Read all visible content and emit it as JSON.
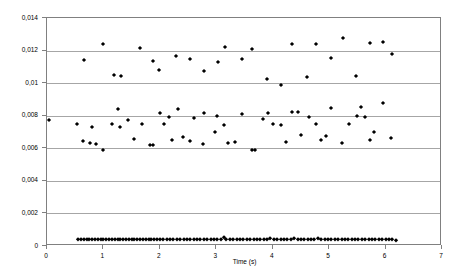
{
  "chart_data": {
    "type": "scatter",
    "title": "",
    "xlabel": "Time (s)",
    "ylabel": "",
    "xlim": [
      0,
      7
    ],
    "ylim": [
      0,
      0.014
    ],
    "grid": true,
    "legend": false,
    "decimal_separator": ",",
    "marker": "diamond",
    "marker_color": "#000000",
    "x_ticks": [
      0,
      1,
      2,
      3,
      4,
      5,
      6,
      7
    ],
    "x_tick_labels": [
      "0",
      "1",
      "2",
      "3",
      "4",
      "5",
      "6",
      "7"
    ],
    "y_ticks": [
      0,
      0.002,
      0.004,
      0.006,
      0.008,
      0.01,
      0.012,
      0.014
    ],
    "y_tick_labels": [
      "0",
      "0,002",
      "0,004",
      "0,006",
      "0,008",
      "0,01",
      "0,012",
      "0,014"
    ],
    "series": [
      {
        "name": "upper-cluster",
        "points": [
          [
            0.66,
            0.01143
          ],
          [
            0.99,
            0.0124
          ],
          [
            1.19,
            0.01049
          ],
          [
            1.32,
            0.01042
          ],
          [
            1.64,
            0.01215
          ],
          [
            1.88,
            0.01133
          ],
          [
            1.99,
            0.01081
          ],
          [
            2.29,
            0.01165
          ],
          [
            2.54,
            0.01148
          ],
          [
            2.78,
            0.01072
          ],
          [
            3.03,
            0.0113
          ],
          [
            3.15,
            0.01221
          ],
          [
            3.45,
            0.01151
          ],
          [
            3.64,
            0.01207
          ],
          [
            3.9,
            0.01028
          ],
          [
            4.14,
            0.00989
          ],
          [
            4.34,
            0.01241
          ],
          [
            4.6,
            0.01035
          ],
          [
            4.76,
            0.01238
          ],
          [
            5.03,
            0.01154
          ],
          [
            5.25,
            0.01277
          ],
          [
            5.48,
            0.01043
          ],
          [
            5.72,
            0.01245
          ],
          [
            5.96,
            0.01252
          ],
          [
            6.12,
            0.01181
          ]
        ]
      },
      {
        "name": "middle-cluster",
        "points": [
          [
            0.03,
            0.00773
          ],
          [
            0.53,
            0.0075
          ],
          [
            0.63,
            0.00643
          ],
          [
            0.77,
            0.00634
          ],
          [
            0.8,
            0.00728
          ],
          [
            0.87,
            0.00628
          ],
          [
            0.99,
            0.00588
          ],
          [
            1.16,
            0.00749
          ],
          [
            1.25,
            0.0084
          ],
          [
            1.29,
            0.00733
          ],
          [
            1.44,
            0.00772
          ],
          [
            1.55,
            0.00659
          ],
          [
            1.69,
            0.0075
          ],
          [
            1.82,
            0.00621
          ],
          [
            1.88,
            0.00618
          ],
          [
            2.01,
            0.00818
          ],
          [
            2.07,
            0.00748
          ],
          [
            2.16,
            0.00795
          ],
          [
            2.21,
            0.00652
          ],
          [
            2.32,
            0.0084
          ],
          [
            2.41,
            0.00671
          ],
          [
            2.54,
            0.00645
          ],
          [
            2.6,
            0.00789
          ],
          [
            2.76,
            0.00628
          ],
          [
            2.79,
            0.00818
          ],
          [
            2.97,
            0.00702
          ],
          [
            3.01,
            0.00799
          ],
          [
            3.13,
            0.00743
          ],
          [
            3.21,
            0.00634
          ],
          [
            3.34,
            0.00639
          ],
          [
            3.45,
            0.00809
          ],
          [
            3.64,
            0.00589
          ],
          [
            3.69,
            0.00589
          ],
          [
            3.82,
            0.00777
          ],
          [
            3.92,
            0.00817
          ],
          [
            4.0,
            0.0075
          ],
          [
            4.14,
            0.00745
          ],
          [
            4.24,
            0.0064
          ],
          [
            4.34,
            0.0082
          ],
          [
            4.44,
            0.00823
          ],
          [
            4.51,
            0.00679
          ],
          [
            4.64,
            0.00792
          ],
          [
            4.76,
            0.00748
          ],
          [
            4.85,
            0.00649
          ],
          [
            4.94,
            0.00677
          ],
          [
            5.04,
            0.0085
          ],
          [
            5.22,
            0.00632
          ],
          [
            5.35,
            0.00748
          ],
          [
            5.49,
            0.00798
          ],
          [
            5.57,
            0.00854
          ],
          [
            5.64,
            0.00793
          ],
          [
            5.72,
            0.00653
          ],
          [
            5.8,
            0.00697
          ],
          [
            5.96,
            0.00879
          ],
          [
            6.1,
            0.00663
          ]
        ]
      },
      {
        "name": "lower-band",
        "points": [
          [
            0.55,
            0.00041
          ],
          [
            0.6,
            0.00041
          ],
          [
            0.65,
            0.00042
          ],
          [
            0.7,
            0.0004
          ],
          [
            0.75,
            0.00042
          ],
          [
            0.8,
            0.00041
          ],
          [
            0.85,
            0.0004
          ],
          [
            0.9,
            0.00042
          ],
          [
            0.95,
            0.00041
          ],
          [
            1.0,
            0.0004
          ],
          [
            1.05,
            0.00042
          ],
          [
            1.1,
            0.00041
          ],
          [
            1.15,
            0.0004
          ],
          [
            1.2,
            0.00042
          ],
          [
            1.25,
            0.00041
          ],
          [
            1.3,
            0.0004
          ],
          [
            1.35,
            0.00042
          ],
          [
            1.4,
            0.00041
          ],
          [
            1.45,
            0.0004
          ],
          [
            1.5,
            0.00042
          ],
          [
            1.55,
            0.00041
          ],
          [
            1.6,
            0.0004
          ],
          [
            1.65,
            0.00042
          ],
          [
            1.7,
            0.00041
          ],
          [
            1.75,
            0.0004
          ],
          [
            1.8,
            0.00042
          ],
          [
            1.85,
            0.00041
          ],
          [
            1.9,
            0.0004
          ],
          [
            1.95,
            0.00042
          ],
          [
            2.0,
            0.00041
          ],
          [
            2.06,
            0.0004
          ],
          [
            2.12,
            0.00042
          ],
          [
            2.18,
            0.00043
          ],
          [
            2.24,
            0.00041
          ],
          [
            2.3,
            0.0004
          ],
          [
            2.36,
            0.00042
          ],
          [
            2.42,
            0.00041
          ],
          [
            2.48,
            0.0004
          ],
          [
            2.54,
            0.00043
          ],
          [
            2.6,
            0.00041
          ],
          [
            2.66,
            0.0004
          ],
          [
            2.72,
            0.00042
          ],
          [
            2.78,
            0.00041
          ],
          [
            2.84,
            0.0004
          ],
          [
            2.9,
            0.00042
          ],
          [
            2.96,
            0.00041
          ],
          [
            3.02,
            0.00043
          ],
          [
            3.08,
            0.0004
          ],
          [
            3.14,
            0.00055
          ],
          [
            3.18,
            0.00041
          ],
          [
            3.24,
            0.0004
          ],
          [
            3.3,
            0.00042
          ],
          [
            3.36,
            0.00041
          ],
          [
            3.42,
            0.0004
          ],
          [
            3.48,
            0.00042
          ],
          [
            3.54,
            0.00041
          ],
          [
            3.6,
            0.0004
          ],
          [
            3.66,
            0.00042
          ],
          [
            3.72,
            0.00041
          ],
          [
            3.78,
            0.0004
          ],
          [
            3.84,
            0.00043
          ],
          [
            3.9,
            0.00041
          ],
          [
            3.96,
            0.00048
          ],
          [
            4.02,
            0.0004
          ],
          [
            4.08,
            0.00042
          ],
          [
            4.14,
            0.00041
          ],
          [
            4.2,
            0.0004
          ],
          [
            4.26,
            0.00042
          ],
          [
            4.32,
            0.00041
          ],
          [
            4.38,
            0.00047
          ],
          [
            4.44,
            0.0004
          ],
          [
            4.5,
            0.00042
          ],
          [
            4.56,
            0.00041
          ],
          [
            4.62,
            0.0004
          ],
          [
            4.68,
            0.00042
          ],
          [
            4.74,
            0.00041
          ],
          [
            4.8,
            0.00048
          ],
          [
            4.86,
            0.0004
          ],
          [
            4.92,
            0.00042
          ],
          [
            4.98,
            0.00041
          ],
          [
            5.04,
            0.0004
          ],
          [
            5.1,
            0.00042
          ],
          [
            5.16,
            0.00041
          ],
          [
            5.22,
            0.0004
          ],
          [
            5.28,
            0.00042
          ],
          [
            5.34,
            0.00041
          ],
          [
            5.4,
            0.0004
          ],
          [
            5.46,
            0.00042
          ],
          [
            5.52,
            0.00041
          ],
          [
            5.58,
            0.0004
          ],
          [
            5.64,
            0.00042
          ],
          [
            5.7,
            0.00041
          ],
          [
            5.76,
            0.0004
          ],
          [
            5.82,
            0.00042
          ],
          [
            5.88,
            0.00041
          ],
          [
            5.94,
            0.0004
          ],
          [
            6.0,
            0.00042
          ],
          [
            6.06,
            0.00041
          ],
          [
            6.12,
            0.0004
          ],
          [
            6.18,
            0.00038
          ]
        ]
      }
    ]
  }
}
